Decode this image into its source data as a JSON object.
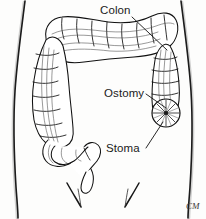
{
  "figure": {
    "background_color": "#fdfdfc",
    "line_color": "#111111",
    "width": 206,
    "height": 219
  },
  "labels": [
    {
      "id": "colon",
      "text": "Colon",
      "x": 100,
      "y": 14,
      "leader_from": [
        132,
        17
      ],
      "leader_to": [
        167,
        50
      ]
    },
    {
      "id": "ostomy",
      "text": "Ostomy",
      "x": 104,
      "y": 97,
      "leader_from": [
        146,
        94
      ],
      "leader_to": [
        166,
        108
      ]
    },
    {
      "id": "stoma",
      "text": "Stoma",
      "x": 106,
      "y": 152,
      "leader_from": [
        146,
        148
      ],
      "leader_to": [
        163,
        122
      ]
    }
  ],
  "signature": {
    "text": "CM",
    "x": 186,
    "y": 209
  },
  "anatomy": {
    "parts": [
      "torso-outline",
      "transverse-colon",
      "ascending-colon",
      "descending-colon",
      "sigmoid-colon",
      "rectum",
      "stoma-site",
      "inguinal-creases"
    ]
  }
}
